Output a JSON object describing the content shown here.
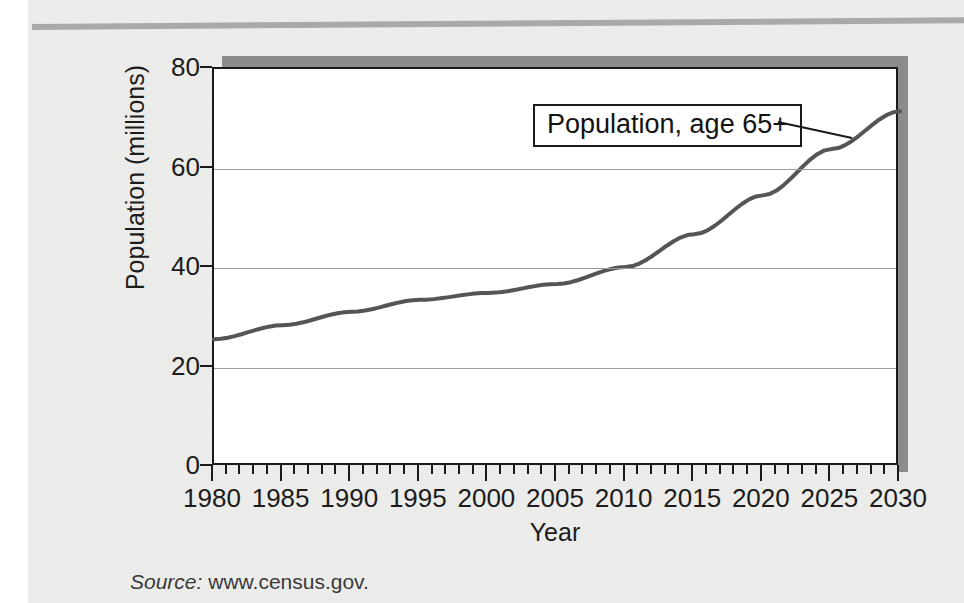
{
  "figure": {
    "source_label": "Source:",
    "source_value": "www.census.gov."
  },
  "chart_data": {
    "type": "line",
    "title": "",
    "xlabel": "Year",
    "ylabel": "Population (millions)",
    "xlim": [
      1980,
      2030
    ],
    "ylim": [
      0,
      80
    ],
    "xtick_labels": [
      "1980",
      "1985",
      "1990",
      "1995",
      "2000",
      "2005",
      "2010",
      "2015",
      "2020",
      "2025",
      "2030"
    ],
    "xtick_values": [
      1980,
      1985,
      1990,
      1995,
      2000,
      2005,
      2010,
      2015,
      2020,
      2025,
      2030
    ],
    "xtick_minor_step": 1,
    "ytick_labels": [
      "0",
      "20",
      "40",
      "60",
      "80"
    ],
    "ytick_values": [
      0,
      20,
      40,
      60,
      80
    ],
    "grid": "horizontal",
    "legend": "annotation-callout",
    "annotations": [
      {
        "text": "Population, age 65+",
        "points_to_x": 2027,
        "points_to_y": 68
      }
    ],
    "series": [
      {
        "name": "Population, age 65+",
        "color": "#555555",
        "x": [
          1980,
          1985,
          1990,
          1995,
          2000,
          2005,
          2010,
          2015,
          2020,
          2025,
          2030
        ],
        "values": [
          25.7,
          28.5,
          31.2,
          33.6,
          35.0,
          36.8,
          40.2,
          46.8,
          54.6,
          63.9,
          71.5
        ]
      }
    ]
  }
}
